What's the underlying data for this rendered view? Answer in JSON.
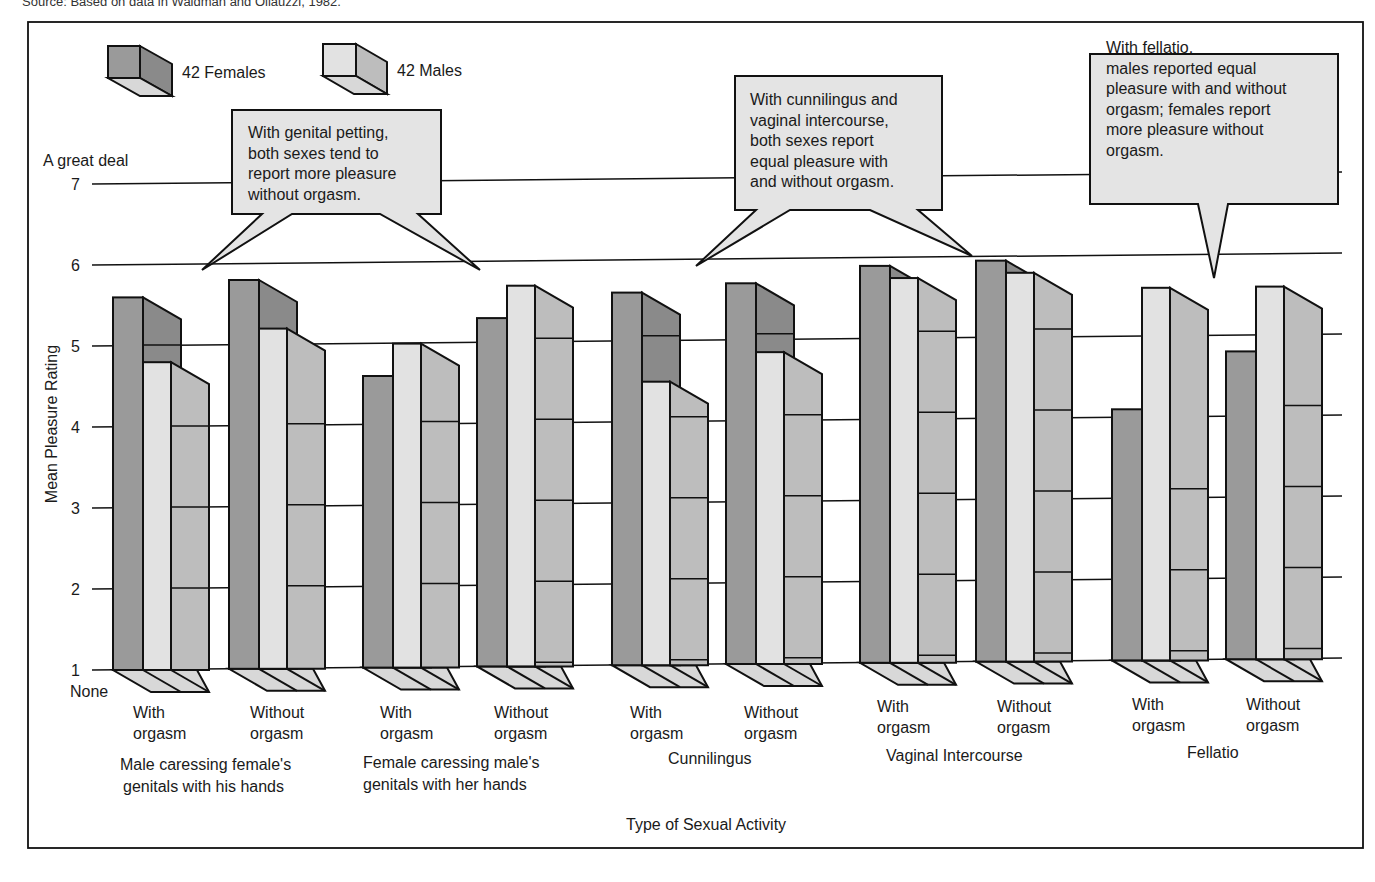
{
  "source_note": "Source: Based on data in Waldman and Oliauzzi, 1982.",
  "chart_data": {
    "type": "bar",
    "style": "3d-grouped",
    "title": "",
    "xlabel": "Type of Sexual Activity",
    "ylabel": "Mean Pleasure Rating",
    "ylim": [
      1,
      7
    ],
    "yticks": [
      1,
      2,
      3,
      4,
      5,
      6,
      7
    ],
    "y_anchor_labels": {
      "top": "A great deal",
      "bottom": "None"
    },
    "grid": true,
    "legend": {
      "position": "top-left",
      "entries": [
        "42 Females",
        "42 Males"
      ]
    },
    "activities": [
      "Male caressing female's genitals with his hands",
      "Female caressing male's genitals with her hands",
      "Cunnilingus",
      "Vaginal Intercourse",
      "Fellatio"
    ],
    "conditions": [
      "With orgasm",
      "Without orgasm"
    ],
    "categories": [
      "Male caressing female's genitals with his hands - With orgasm",
      "Male caressing female's genitals with his hands - Without orgasm",
      "Female caressing male's genitals with her hands - With orgasm",
      "Female caressing male's genitals with her hands - Without orgasm",
      "Cunnilingus - With orgasm",
      "Cunnilingus - Without orgasm",
      "Vaginal Intercourse - With orgasm",
      "Vaginal Intercourse - Without orgasm",
      "Fellatio - With orgasm",
      "Fellatio - Without orgasm"
    ],
    "series": [
      {
        "name": "42 Females",
        "color": "#9a9a9a",
        "values": [
          5.6,
          5.8,
          4.6,
          5.3,
          5.6,
          5.7,
          5.9,
          5.95,
          4.1,
          4.8
        ]
      },
      {
        "name": "42 Males",
        "color": "#e2e2e2",
        "values": [
          4.8,
          5.2,
          5.0,
          5.7,
          4.5,
          4.85,
          5.75,
          5.8,
          5.6,
          5.6
        ]
      }
    ],
    "annotations": [
      "With genital petting, both sexes tend to report more pleasure without orgasm.",
      "With cunnilingus and vaginal intercourse, both sexes report equal pleasure with and without orgasm.",
      "With fellatio, males reported equal pleasure with and without orgasm; females report more pleasure without orgasm."
    ]
  },
  "colors": {
    "female_front": "#9a9a9a",
    "female_side": "#8a8a8a",
    "male_front": "#e2e2e2",
    "male_side": "#bdbdbd",
    "base": "#d8d8d8",
    "callout_fill": "#e4e4e4",
    "stroke": "#111111"
  },
  "legend": {
    "females": "42 Females",
    "males": "42 Males"
  },
  "axis": {
    "ylabel": "Mean Pleasure Rating",
    "xlabel": "Type of Sexual Activity",
    "top_anchor": "A great deal",
    "bottom_anchor": "None",
    "ticks": [
      "7",
      "6",
      "5",
      "4",
      "3",
      "2",
      "1"
    ]
  },
  "bar_labels": [
    {
      "line1": "With",
      "line2": "orgasm"
    },
    {
      "line1": "Without",
      "line2": "orgasm"
    },
    {
      "line1": "With",
      "line2": "orgasm"
    },
    {
      "line1": "Without",
      "line2": "orgasm"
    },
    {
      "line1": "With",
      "line2": "orgasm"
    },
    {
      "line1": "Without",
      "line2": "orgasm"
    },
    {
      "line1": "With",
      "line2": "orgasm"
    },
    {
      "line1": "Without",
      "line2": "orgasm"
    },
    {
      "line1": "With",
      "line2": "orgasm"
    },
    {
      "line1": "Without",
      "line2": "orgasm"
    }
  ],
  "group_labels": [
    {
      "line1": "Male caressing female's",
      "line2": "genitals with his hands"
    },
    {
      "line1": "Female caressing male's",
      "line2": "genitals with her hands"
    },
    {
      "line1": "Cunnilingus",
      "line2": ""
    },
    {
      "line1": "Vaginal Intercourse",
      "line2": ""
    },
    {
      "line1": "Fellatio",
      "line2": ""
    }
  ],
  "callouts": [
    {
      "lines": [
        "With genital petting,",
        "both sexes tend to",
        "report more pleasure",
        "without orgasm."
      ]
    },
    {
      "lines": [
        "With cunnilingus and",
        "vaginal intercourse,",
        "both sexes report",
        "equal pleasure with",
        "and without orgasm."
      ]
    },
    {
      "lines": [
        "With fellatio,",
        "males reported equal",
        "pleasure with and without",
        "orgasm; females report",
        "more pleasure without",
        "orgasm."
      ]
    }
  ]
}
